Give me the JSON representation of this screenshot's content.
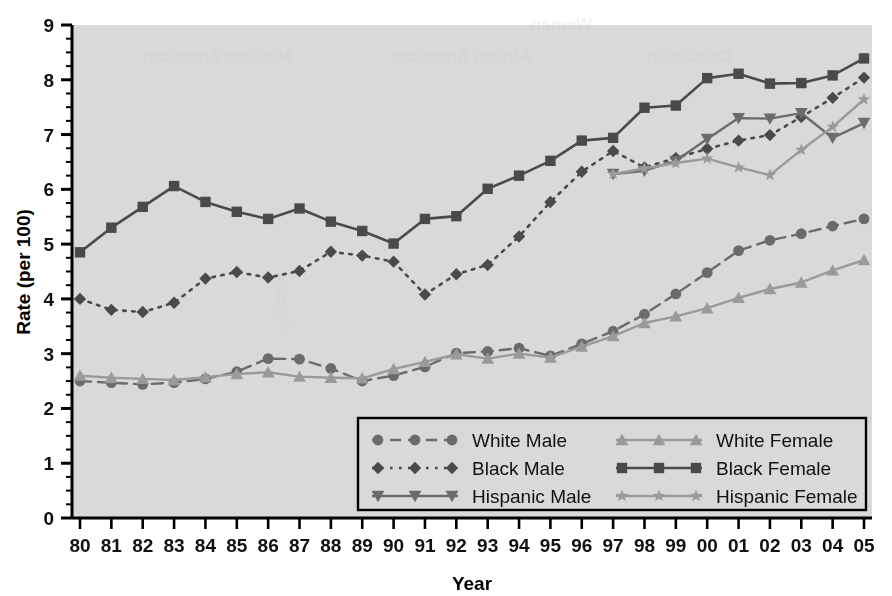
{
  "chart_data": {
    "type": "line",
    "title": "",
    "xlabel": "Year",
    "ylabel": "Rate (per 100)",
    "xlim": [
      1980,
      2005
    ],
    "ylim": [
      0,
      9
    ],
    "grid": false,
    "legend_position": "inside-bottom-center",
    "plot_background": "#d9d9d9",
    "x": [
      1980,
      1981,
      1982,
      1983,
      1984,
      1985,
      1986,
      1987,
      1988,
      1989,
      1990,
      1991,
      1992,
      1993,
      1994,
      1995,
      1996,
      1997,
      1998,
      1999,
      2000,
      2001,
      2002,
      2003,
      2004,
      2005
    ],
    "categories": [
      "80",
      "81",
      "82",
      "83",
      "84",
      "85",
      "86",
      "87",
      "88",
      "89",
      "90",
      "91",
      "92",
      "93",
      "94",
      "95",
      "96",
      "97",
      "98",
      "99",
      "00",
      "01",
      "02",
      "03",
      "04",
      "05"
    ],
    "yticks": [
      0,
      1,
      2,
      3,
      4,
      5,
      6,
      7,
      8,
      9
    ],
    "ytick_labels": [
      "0",
      "1",
      "2",
      "3",
      "4",
      "5",
      "6",
      "7",
      "8",
      "9"
    ],
    "minor_tick_step": 0.25,
    "series": [
      {
        "name": "White Male",
        "color": "#6b6b6b",
        "marker": "circle",
        "dash": "dashed",
        "values": [
          2.5,
          2.47,
          2.44,
          2.47,
          2.54,
          2.67,
          2.91,
          2.9,
          2.73,
          2.5,
          2.6,
          2.76,
          3.01,
          3.04,
          3.1,
          2.96,
          3.18,
          3.41,
          3.72,
          4.09,
          4.48,
          4.88,
          5.07,
          5.19,
          5.33,
          5.46
        ]
      },
      {
        "name": "Black Male",
        "color": "#4a4a4a",
        "marker": "diamond",
        "dash": "dotted",
        "values": [
          4.0,
          3.8,
          3.76,
          3.93,
          4.37,
          4.49,
          4.39,
          4.51,
          4.86,
          4.79,
          4.68,
          4.08,
          4.45,
          4.62,
          5.14,
          5.77,
          6.32,
          6.7,
          6.4,
          6.57,
          6.74,
          6.89,
          6.99,
          7.32,
          7.67,
          8.04
        ]
      },
      {
        "name": "Hispanic Male",
        "color": "#6b6b6b",
        "marker": "triangle-down",
        "dash": "solid",
        "values": [
          null,
          null,
          null,
          null,
          null,
          null,
          null,
          null,
          null,
          null,
          null,
          null,
          null,
          null,
          null,
          null,
          null,
          6.28,
          6.34,
          6.52,
          6.92,
          7.3,
          7.29,
          7.39,
          6.94,
          7.21
        ]
      },
      {
        "name": "White Female",
        "color": "#9a9a9a",
        "marker": "triangle-up",
        "dash": "solid",
        "values": [
          2.6,
          2.56,
          2.54,
          2.52,
          2.57,
          2.63,
          2.66,
          2.58,
          2.56,
          2.55,
          2.72,
          2.85,
          2.99,
          2.91,
          3.0,
          2.93,
          3.13,
          3.32,
          3.56,
          3.68,
          3.83,
          4.02,
          4.18,
          4.3,
          4.52,
          4.71
        ]
      },
      {
        "name": "Black Female",
        "color": "#4a4a4a",
        "marker": "square",
        "dash": "solid",
        "values": [
          4.85,
          5.3,
          5.68,
          6.06,
          5.77,
          5.59,
          5.46,
          5.65,
          5.41,
          5.24,
          5.01,
          5.46,
          5.51,
          6.01,
          6.25,
          6.52,
          6.89,
          6.94,
          7.49,
          7.53,
          8.03,
          8.11,
          7.93,
          7.94,
          8.08,
          8.39
        ]
      },
      {
        "name": "Hispanic Female",
        "color": "#9a9a9a",
        "marker": "star",
        "dash": "solid",
        "values": [
          null,
          null,
          null,
          null,
          null,
          null,
          null,
          null,
          null,
          null,
          null,
          null,
          null,
          null,
          null,
          null,
          null,
          6.28,
          6.38,
          6.48,
          6.56,
          6.4,
          6.26,
          6.72,
          7.14,
          7.64
        ]
      }
    ]
  },
  "legend": {
    "entries": [
      {
        "label": "White Male"
      },
      {
        "label": "White Female"
      },
      {
        "label": "Black Male"
      },
      {
        "label": "Black Female"
      },
      {
        "label": "Hispanic Male"
      },
      {
        "label": "Hispanic Female"
      }
    ]
  },
  "watermark": {
    "lines": [
      "Women",
      "Caucasian",
      "African American",
      "Mexican American"
    ]
  }
}
